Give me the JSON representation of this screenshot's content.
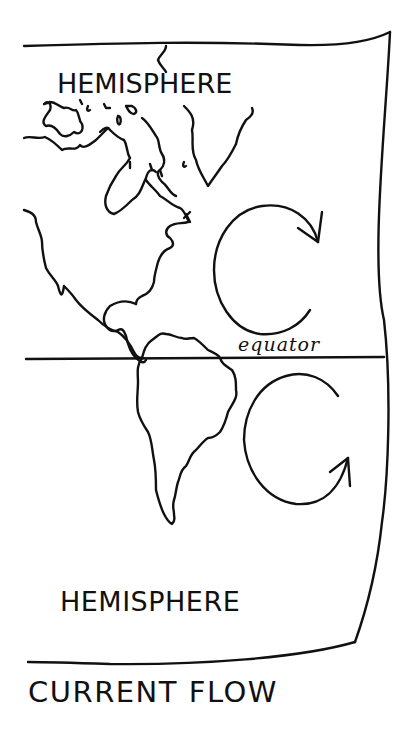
{
  "diagram": {
    "title": "CURRENT FLOW",
    "labels": {
      "northern": "HEMISPHERE",
      "southern": "HEMISPHERE",
      "equator": "equator"
    },
    "gyres": [
      {
        "hemisphere": "northern",
        "direction": "clockwise"
      },
      {
        "hemisphere": "southern",
        "direction": "counterclockwise"
      }
    ],
    "colors": {
      "ink": "#111111",
      "paper": "#ffffff"
    }
  }
}
